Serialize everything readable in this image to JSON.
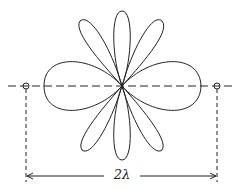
{
  "diagram": {
    "type": "radiation-pattern",
    "dimension_label": "2λ",
    "sources": [
      {
        "name": "left-source",
        "x": 26,
        "y": 86
      },
      {
        "name": "right-source",
        "x": 217,
        "y": 86
      }
    ],
    "lobes": {
      "count": 8,
      "major_axis": "horizontal",
      "center": [
        122,
        86
      ]
    },
    "colors": {
      "line": "#222222",
      "background": "#ffffff"
    }
  }
}
